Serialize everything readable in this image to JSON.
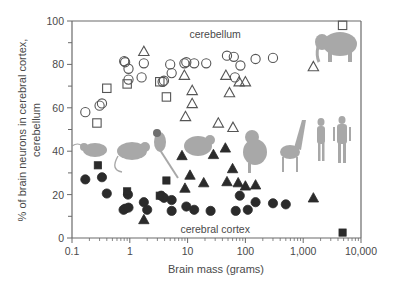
{
  "chart_data": {
    "type": "scatter",
    "title": "",
    "xlabel": "Brain mass (grams)",
    "ylabel_lines": [
      "% of brain neurons in cerebral cortex,",
      "cerebellum"
    ],
    "xscale": "log",
    "xlim": [
      0.1,
      10000
    ],
    "ylim": [
      0,
      100
    ],
    "x_ticks": [
      0.1,
      1,
      10,
      100,
      1000,
      10000
    ],
    "x_tick_labels": [
      "0.1",
      "1",
      "10",
      "100",
      "1,000",
      "10,000"
    ],
    "y_ticks": [
      0,
      20,
      40,
      60,
      80,
      100
    ],
    "y_tick_labels": [
      "0",
      "20",
      "40",
      "60",
      "80",
      "100"
    ],
    "grid": false,
    "annotations": [
      {
        "text": "cerebellum",
        "x": 30,
        "y": 94
      },
      {
        "text": "cerebral cortex",
        "x": 30,
        "y": 4
      }
    ],
    "series": [
      {
        "name": "Rodents - cerebellum",
        "region": "cerebellum",
        "marker": "open-circle",
        "points": [
          [
            0.17,
            58
          ],
          [
            0.3,
            61
          ],
          [
            0.33,
            62
          ],
          [
            0.8,
            81.5
          ],
          [
            0.83,
            81
          ],
          [
            0.95,
            78
          ],
          [
            0.95,
            73
          ],
          [
            1.6,
            74
          ],
          [
            1.75,
            80.5
          ],
          [
            3.7,
            72
          ],
          [
            3.9,
            72.5
          ],
          [
            5.0,
            80
          ],
          [
            5.3,
            76
          ],
          [
            8.8,
            80.5
          ],
          [
            9.5,
            81
          ],
          [
            13,
            80.5
          ],
          [
            21,
            80.5
          ],
          [
            48,
            84
          ],
          [
            63,
            83.5
          ],
          [
            82,
            79.5
          ],
          [
            66,
            74
          ],
          [
            150,
            82.5
          ],
          [
            300,
            83
          ]
        ]
      },
      {
        "name": "Insectivores - cerebellum",
        "region": "cerebellum",
        "marker": "open-square",
        "points": [
          [
            0.27,
            53
          ],
          [
            0.4,
            69
          ],
          [
            0.9,
            71
          ],
          [
            3.3,
            72
          ],
          [
            4.3,
            65
          ],
          [
            4800,
            98
          ]
        ]
      },
      {
        "name": "Primates - cerebellum",
        "region": "cerebellum",
        "marker": "open-triangle",
        "points": [
          [
            1.75,
            86
          ],
          [
            8.8,
            75
          ],
          [
            12,
            68
          ],
          [
            9.2,
            56
          ],
          [
            12,
            62
          ],
          [
            46,
            75
          ],
          [
            53,
            67
          ],
          [
            78,
            72
          ],
          [
            100,
            72
          ],
          [
            34,
            53
          ],
          [
            61,
            51
          ],
          [
            1500,
            79
          ]
        ]
      },
      {
        "name": "Rodents - cerebral cortex",
        "region": "cerebral cortex",
        "marker": "filled-circle",
        "points": [
          [
            0.17,
            27
          ],
          [
            0.33,
            28
          ],
          [
            0.4,
            20.5
          ],
          [
            0.78,
            13
          ],
          [
            0.83,
            13.5
          ],
          [
            0.95,
            14
          ],
          [
            0.93,
            20
          ],
          [
            1.75,
            16.5
          ],
          [
            2.0,
            13
          ],
          [
            3.5,
            19.5
          ],
          [
            3.9,
            18.5
          ],
          [
            5.3,
            17.5
          ],
          [
            5.3,
            12.5
          ],
          [
            9.5,
            14.5
          ],
          [
            13,
            13
          ],
          [
            25,
            12.5
          ],
          [
            68,
            12.5
          ],
          [
            110,
            13
          ],
          [
            80,
            19.5
          ],
          [
            150,
            16.5
          ],
          [
            300,
            16
          ],
          [
            500,
            15.5
          ]
        ]
      },
      {
        "name": "Insectivores - cerebral cortex",
        "region": "cerebral cortex",
        "marker": "filled-square",
        "points": [
          [
            0.28,
            33.5
          ],
          [
            0.9,
            21.5
          ],
          [
            4.3,
            26.5
          ],
          [
            3.3,
            19.5
          ],
          [
            4800,
            2.5
          ]
        ]
      },
      {
        "name": "Primates - cerebral cortex",
        "region": "cerebral cortex",
        "marker": "filled-triangle",
        "points": [
          [
            1.75,
            8.5
          ],
          [
            9.0,
            23
          ],
          [
            8.0,
            38
          ],
          [
            11,
            29
          ],
          [
            28,
            38.5
          ],
          [
            45,
            41.5
          ],
          [
            19,
            25.5
          ],
          [
            48,
            26
          ],
          [
            60,
            32
          ],
          [
            75,
            25.5
          ],
          [
            100,
            24
          ],
          [
            150,
            24.5
          ],
          [
            1500,
            18.5
          ]
        ]
      }
    ]
  },
  "illustrations": {
    "animals": [
      "mouse",
      "rat",
      "squirrel",
      "agouti",
      "capybara",
      "monkey",
      "giraffe",
      "human-female",
      "human-male",
      "elephant"
    ]
  }
}
